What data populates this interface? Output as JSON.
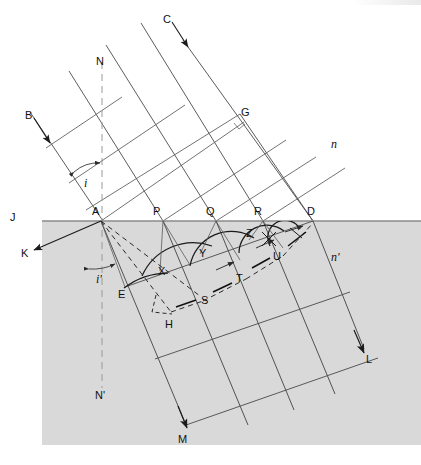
{
  "figure": {
    "canvas": {
      "width": 421,
      "height": 465
    },
    "colors": {
      "background": "#ffffff",
      "medium_lower": "#d9d9d9",
      "line": "#3a3a3a",
      "line_bold": "#1b1b1b",
      "surface": "#8a8a8a",
      "normal_dashed": "#9a9a9a",
      "text": "#111111"
    },
    "geometry": {
      "surface_y": 221,
      "point_A_x": 101,
      "point_D_x": 313,
      "normal_x": 102,
      "incident_angle_deg": 34,
      "refraction_angle_deg": 20
    }
  },
  "labels": {
    "media": {
      "upper_index": "n",
      "lower_index": "n'"
    },
    "angles": {
      "incidence": "i",
      "refraction": "i'"
    },
    "rays": {
      "incident_left": "B",
      "incident_right": "C",
      "reflected": "K",
      "refracted_left": "M",
      "refracted_right": "L"
    },
    "normal": {
      "upper": "N",
      "lower": "N'"
    },
    "surface": {
      "left_end": "J"
    },
    "points": [
      {
        "id": "A",
        "text": "A",
        "x": 92,
        "y": 206
      },
      {
        "id": "P",
        "text": "P",
        "x": 153,
        "y": 206
      },
      {
        "id": "Q",
        "text": "Q",
        "x": 206,
        "y": 206
      },
      {
        "id": "R",
        "text": "R",
        "x": 254,
        "y": 206
      },
      {
        "id": "D",
        "text": "D",
        "x": 307,
        "y": 206
      },
      {
        "id": "G",
        "text": "G",
        "x": 241,
        "y": 107
      },
      {
        "id": "X",
        "text": "X",
        "x": 158,
        "y": 266
      },
      {
        "id": "Y",
        "text": "Y",
        "x": 199,
        "y": 248
      },
      {
        "id": "Z",
        "text": "Z",
        "x": 246,
        "y": 228
      },
      {
        "id": "U",
        "text": "U",
        "x": 273,
        "y": 251
      },
      {
        "id": "T",
        "text": "T",
        "x": 236,
        "y": 273
      },
      {
        "id": "S",
        "text": "S",
        "x": 201,
        "y": 295
      },
      {
        "id": "E",
        "text": "E",
        "x": 118,
        "y": 289
      },
      {
        "id": "H",
        "text": "H",
        "x": 165,
        "y": 319
      },
      {
        "id": "N",
        "text": "N",
        "x": 96,
        "y": 56
      },
      {
        "id": "N2",
        "text": "N'",
        "x": 95,
        "y": 390
      },
      {
        "id": "J",
        "text": "J",
        "x": 10,
        "y": 212
      },
      {
        "id": "K",
        "text": "K",
        "x": 21,
        "y": 248
      },
      {
        "id": "B",
        "text": "B",
        "x": 25,
        "y": 110
      },
      {
        "id": "C",
        "text": "C",
        "x": 163,
        "y": 14
      },
      {
        "id": "L",
        "text": "L",
        "x": 366,
        "y": 354
      },
      {
        "id": "M",
        "text": "M",
        "x": 178,
        "y": 434
      },
      {
        "id": "n",
        "text": "n",
        "x": 331,
        "y": 138
      },
      {
        "id": "np",
        "text": "n'",
        "x": 331,
        "y": 251
      },
      {
        "id": "i",
        "text": "i",
        "x": 84,
        "y": 177
      },
      {
        "id": "ip",
        "text": "i'",
        "x": 96,
        "y": 273
      }
    ]
  },
  "description": {
    "upper_medium": "incident plane wavefronts travelling down-right in medium n",
    "lower_medium": "refracted wavefronts in denser medium n' (shaded)",
    "wavelets": "Huygens secondary wavelets centred on A, P, Q, R with decreasing radii, tangent to wavefront DE",
    "right_angle_at_G": "wavefront DG is perpendicular to the incident ray direction"
  }
}
